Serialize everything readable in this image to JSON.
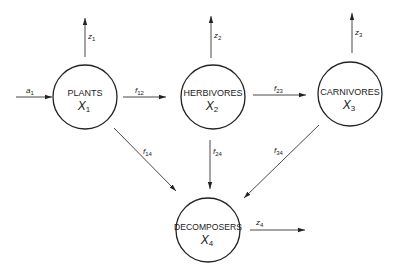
{
  "diagram": {
    "type": "compartment-flow",
    "nodes": [
      {
        "id": "x1",
        "label": "PLANTS",
        "var": "X",
        "sub": "1"
      },
      {
        "id": "x2",
        "label": "HERBIVORES",
        "var": "X",
        "sub": "2"
      },
      {
        "id": "x3",
        "label": "CARNIVORES",
        "var": "X",
        "sub": "3"
      },
      {
        "id": "x4",
        "label": "DECOMPOSERS",
        "var": "X",
        "sub": "4"
      }
    ],
    "flows": [
      {
        "id": "a1",
        "from": "external",
        "to": "x1",
        "var": "a",
        "sub": "1"
      },
      {
        "id": "z1",
        "from": "x1",
        "to": "external",
        "var": "z",
        "sub": "1"
      },
      {
        "id": "z2",
        "from": "x2",
        "to": "external",
        "var": "z",
        "sub": "2"
      },
      {
        "id": "z3",
        "from": "x3",
        "to": "external",
        "var": "z",
        "sub": "3"
      },
      {
        "id": "z4",
        "from": "x4",
        "to": "external",
        "var": "z",
        "sub": "4"
      },
      {
        "id": "f12",
        "from": "x1",
        "to": "x2",
        "var": "f",
        "sub": "12"
      },
      {
        "id": "f23",
        "from": "x2",
        "to": "x3",
        "var": "f",
        "sub": "23"
      },
      {
        "id": "f14",
        "from": "x1",
        "to": "x4",
        "var": "f",
        "sub": "14"
      },
      {
        "id": "f24",
        "from": "x2",
        "to": "x4",
        "var": "f",
        "sub": "24"
      },
      {
        "id": "f34",
        "from": "x3",
        "to": "x4",
        "var": "f",
        "sub": "34"
      }
    ]
  }
}
